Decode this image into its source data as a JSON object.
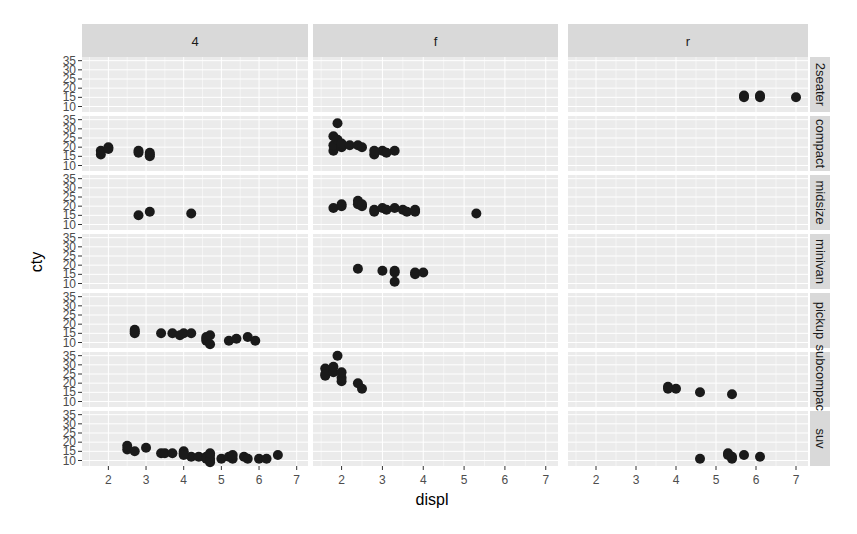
{
  "chart_data": {
    "type": "scatter",
    "title": "",
    "xlabel": "displ",
    "ylabel": "cty",
    "xlim": [
      1.3,
      7.3
    ],
    "ylim": [
      7,
      37
    ],
    "x_ticks": [
      2,
      3,
      4,
      5,
      6,
      7
    ],
    "y_ticks": [
      10,
      15,
      20,
      25,
      30,
      35
    ],
    "grid": true,
    "facet_cols": [
      "4",
      "f",
      "r"
    ],
    "facet_rows": [
      "2seater",
      "compact",
      "midsize",
      "minivan",
      "pickup",
      "subcompact",
      "suv"
    ],
    "colors": {
      "panel_bg": "#ebebeb",
      "strip_bg": "#d9d9d9",
      "grid": "#ffffff",
      "point": "#1a1a1a"
    },
    "panels": [
      {
        "row": "2seater",
        "col": "r",
        "points": [
          [
            5.7,
            16
          ],
          [
            5.7,
            15
          ],
          [
            6.1,
            15
          ],
          [
            6.1,
            16
          ],
          [
            7.0,
            15
          ]
        ]
      },
      {
        "row": "compact",
        "col": "4",
        "points": [
          [
            1.8,
            18
          ],
          [
            1.8,
            16
          ],
          [
            2.0,
            20
          ],
          [
            2.0,
            19
          ],
          [
            2.8,
            17
          ],
          [
            2.8,
            18
          ],
          [
            3.1,
            15
          ],
          [
            3.1,
            17
          ],
          [
            3.1,
            16
          ]
        ]
      },
      {
        "row": "compact",
        "col": "f",
        "points": [
          [
            1.8,
            18
          ],
          [
            1.8,
            21
          ],
          [
            2.0,
            20
          ],
          [
            2.0,
            21
          ],
          [
            1.9,
            33
          ],
          [
            1.9,
            24
          ],
          [
            2.0,
            22
          ],
          [
            1.8,
            26
          ],
          [
            2.2,
            21
          ],
          [
            2.4,
            21
          ],
          [
            2.5,
            20
          ],
          [
            2.8,
            16
          ],
          [
            3.0,
            18
          ],
          [
            3.3,
            18
          ],
          [
            3.1,
            17
          ],
          [
            2.8,
            18
          ]
        ]
      },
      {
        "row": "midsize",
        "col": "4",
        "points": [
          [
            2.8,
            15
          ],
          [
            3.1,
            17
          ],
          [
            4.2,
            16
          ]
        ]
      },
      {
        "row": "midsize",
        "col": "f",
        "points": [
          [
            1.8,
            19
          ],
          [
            2.0,
            21
          ],
          [
            2.0,
            20
          ],
          [
            2.4,
            21
          ],
          [
            2.4,
            23
          ],
          [
            2.5,
            20
          ],
          [
            2.5,
            21
          ],
          [
            2.8,
            18
          ],
          [
            2.8,
            17
          ],
          [
            3.0,
            19
          ],
          [
            3.1,
            18
          ],
          [
            3.3,
            19
          ],
          [
            3.5,
            18
          ],
          [
            3.6,
            17
          ],
          [
            3.8,
            17
          ],
          [
            3.8,
            18
          ],
          [
            5.3,
            16
          ]
        ]
      },
      {
        "row": "minivan",
        "col": "f",
        "points": [
          [
            2.4,
            18
          ],
          [
            3.0,
            17
          ],
          [
            3.3,
            17
          ],
          [
            3.3,
            16
          ],
          [
            3.3,
            11
          ],
          [
            3.8,
            15
          ],
          [
            3.8,
            16
          ],
          [
            4.0,
            16
          ]
        ]
      },
      {
        "row": "pickup",
        "col": "4",
        "points": [
          [
            2.7,
            15
          ],
          [
            2.7,
            17
          ],
          [
            2.7,
            16
          ],
          [
            3.4,
            15
          ],
          [
            3.7,
            15
          ],
          [
            3.9,
            14
          ],
          [
            4.0,
            15
          ],
          [
            4.2,
            15
          ],
          [
            4.6,
            13
          ],
          [
            4.6,
            11
          ],
          [
            4.6,
            12
          ],
          [
            4.7,
            14
          ],
          [
            5.2,
            11
          ],
          [
            5.4,
            12
          ],
          [
            5.7,
            13
          ],
          [
            5.9,
            11
          ],
          [
            4.7,
            9
          ]
        ]
      },
      {
        "row": "subcompact",
        "col": "f",
        "points": [
          [
            1.6,
            28
          ],
          [
            1.6,
            24
          ],
          [
            1.6,
            25
          ],
          [
            1.8,
            26
          ],
          [
            1.8,
            29
          ],
          [
            1.9,
            35
          ],
          [
            2.0,
            21
          ],
          [
            2.0,
            23
          ],
          [
            2.4,
            20
          ],
          [
            2.5,
            17
          ],
          [
            2.0,
            26
          ]
        ]
      },
      {
        "row": "subcompact",
        "col": "r",
        "points": [
          [
            3.8,
            18
          ],
          [
            4.0,
            17
          ],
          [
            4.6,
            15
          ],
          [
            5.4,
            14
          ],
          [
            3.8,
            17
          ]
        ]
      },
      {
        "row": "suv",
        "col": "4",
        "points": [
          [
            2.5,
            18
          ],
          [
            2.5,
            16
          ],
          [
            2.7,
            15
          ],
          [
            3.0,
            17
          ],
          [
            3.4,
            14
          ],
          [
            3.5,
            14
          ],
          [
            3.7,
            14
          ],
          [
            4.0,
            14
          ],
          [
            4.0,
            15
          ],
          [
            4.2,
            12
          ],
          [
            4.4,
            12
          ],
          [
            4.6,
            12
          ],
          [
            4.6,
            11
          ],
          [
            4.7,
            13
          ],
          [
            4.7,
            9
          ],
          [
            4.7,
            11
          ],
          [
            4.7,
            10
          ],
          [
            5.0,
            11
          ],
          [
            5.2,
            12
          ],
          [
            5.3,
            11
          ],
          [
            5.3,
            13
          ],
          [
            5.6,
            12
          ],
          [
            5.7,
            11
          ],
          [
            6.0,
            11
          ],
          [
            6.2,
            11
          ],
          [
            6.5,
            13
          ],
          [
            4.0,
            13
          ],
          [
            4.7,
            14
          ]
        ]
      },
      {
        "row": "suv",
        "col": "r",
        "points": [
          [
            4.6,
            11
          ],
          [
            5.3,
            14
          ],
          [
            5.3,
            13
          ],
          [
            5.4,
            11
          ],
          [
            5.4,
            12
          ],
          [
            5.7,
            13
          ],
          [
            6.1,
            12
          ]
        ]
      }
    ]
  }
}
